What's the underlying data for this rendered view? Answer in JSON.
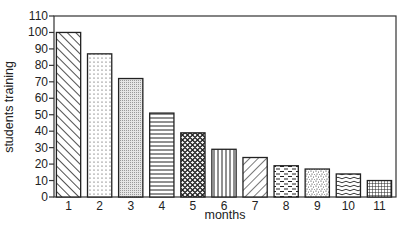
{
  "chart_data": {
    "type": "bar",
    "title": "",
    "xlabel": "months",
    "ylabel": "students training",
    "categories": [
      "1",
      "2",
      "3",
      "4",
      "5",
      "6",
      "7",
      "8",
      "9",
      "10",
      "11"
    ],
    "values": [
      100,
      87,
      72,
      51,
      39,
      29,
      24,
      19,
      17,
      14,
      10
    ],
    "ylim": [
      0,
      110
    ],
    "yticks": [
      0,
      10,
      20,
      30,
      40,
      50,
      60,
      70,
      80,
      90,
      100,
      110
    ],
    "grid": false,
    "legend": null,
    "bar_patterns": [
      "diagonal-up",
      "dots",
      "fine-stipple",
      "horizontal-lines",
      "crosshatch-diamond",
      "vertical-lines",
      "diagonal-down",
      "brick-dashes",
      "speckle",
      "waves",
      "grid"
    ]
  },
  "colors": {
    "ink": "#222222",
    "background": "#ffffff"
  }
}
